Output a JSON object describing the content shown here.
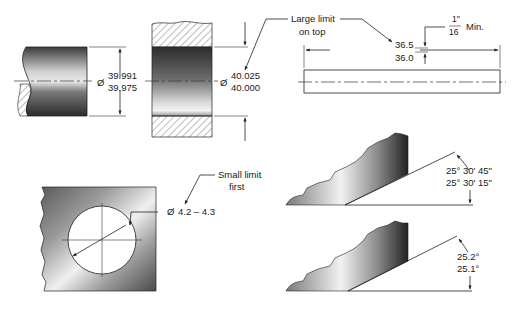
{
  "figure": {
    "shaft": {
      "symbol": "Ø",
      "upper_limit": "39.991",
      "lower_limit": "39.975"
    },
    "bore": {
      "symbol": "Ø",
      "upper_limit": "40.025",
      "lower_limit": "40.000"
    },
    "callout_large_limit": {
      "line1": "Large limit",
      "line2": "on top"
    },
    "bar_length": {
      "upper_limit": "36.5",
      "lower_limit": "36.0"
    },
    "spacing_note": {
      "numerator": "1\"",
      "denominator": "16",
      "suffix": "Min."
    },
    "hole": {
      "symbol": "Ø",
      "range": "4.2 – 4.3"
    },
    "callout_small_limit": {
      "line1": "Small limit",
      "line2": "first"
    },
    "angle_dms": {
      "upper_limit": "25° 30' 45\"",
      "lower_limit": "25° 30' 15\""
    },
    "angle_decimal": {
      "upper_limit": "25.2°",
      "lower_limit": "25.1°"
    }
  }
}
